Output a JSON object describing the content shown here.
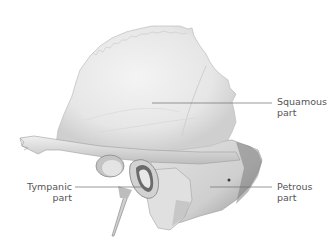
{
  "figure": {
    "labels": [
      {
        "id": "squamous",
        "line1": "Squamous",
        "line2": "part"
      },
      {
        "id": "tympanic",
        "line1": "Tympanic",
        "line2": "part"
      },
      {
        "id": "petrous",
        "line1": "Petrous",
        "line2": "part"
      }
    ]
  },
  "colors": {
    "background": "#ffffff",
    "bone_light": "#ececec",
    "bone_mid": "#d6d6d6",
    "bone_shadow": "#9a9a9a",
    "bone_dark": "#5a5a5a",
    "leader_line": "#6e6e6e",
    "label_text": "#555555"
  }
}
